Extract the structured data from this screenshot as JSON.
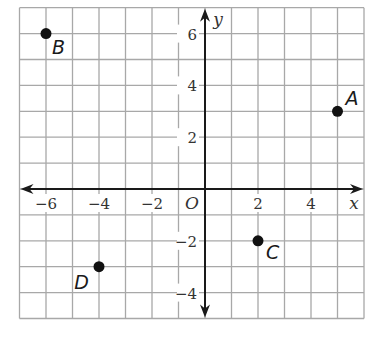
{
  "chart_data": {
    "type": "scatter",
    "title": "",
    "xlabel": "x",
    "ylabel": "y",
    "origin_label": "O",
    "xlim": [
      -7,
      6
    ],
    "ylim": [
      -5,
      7
    ],
    "grid": true,
    "x_ticks": [
      -6,
      -4,
      -2,
      2,
      4
    ],
    "y_ticks": [
      6,
      4,
      2,
      -2,
      -4
    ],
    "x_tick_labels": [
      "−6",
      "−4",
      "−2",
      "2",
      "4"
    ],
    "y_tick_labels": [
      "6",
      "4",
      "2",
      "−2",
      "−4"
    ],
    "points": [
      {
        "label": "A",
        "x": 5,
        "y": 3
      },
      {
        "label": "B",
        "x": -6,
        "y": 6
      },
      {
        "label": "C",
        "x": 2,
        "y": -2
      },
      {
        "label": "D",
        "x": -4,
        "y": -3
      }
    ],
    "colors": {
      "grid": "#a8a8a8",
      "axis": "#1a1a1a",
      "point": "#111111"
    }
  }
}
